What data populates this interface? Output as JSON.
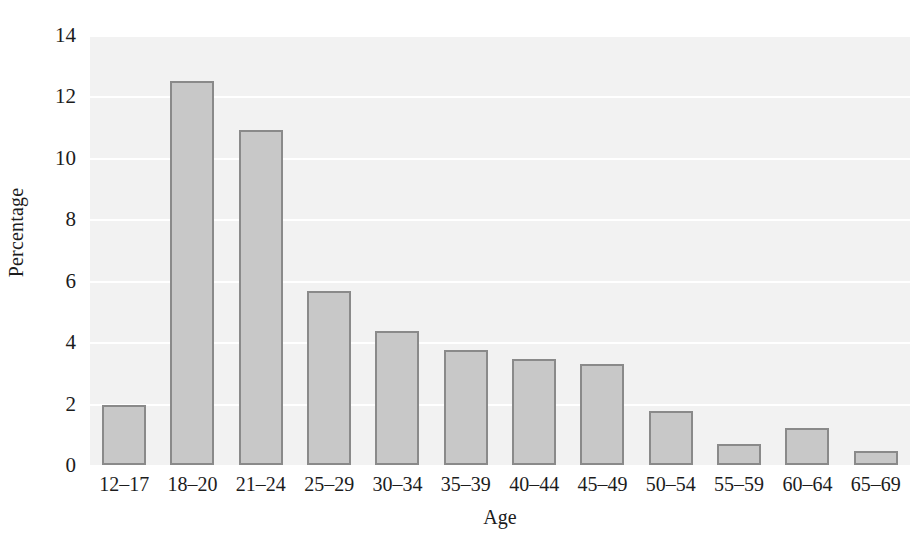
{
  "chart_data": {
    "type": "bar",
    "title": "",
    "subtitle": "",
    "xlabel": "Age",
    "ylabel": "Percentage",
    "categories": [
      "12–17",
      "18–20",
      "21–24",
      "25–29",
      "30–34",
      "35–39",
      "40–44",
      "45–49",
      "50–54",
      "55–59",
      "60–64",
      "65–69"
    ],
    "values": [
      1.95,
      12.5,
      10.9,
      5.65,
      4.35,
      3.75,
      3.45,
      3.3,
      1.75,
      0.7,
      1.2,
      0.45
    ],
    "series": [
      {
        "name": "Percentage",
        "values": [
          1.95,
          12.5,
          10.9,
          5.65,
          4.35,
          3.75,
          3.45,
          3.3,
          1.75,
          0.7,
          1.2,
          0.45
        ]
      }
    ],
    "ylim": [
      0,
      14
    ],
    "yticks": [
      0,
      2,
      4,
      6,
      8,
      10,
      12,
      14
    ],
    "ytick_labels": [
      "0",
      "2",
      "4",
      "6",
      "8",
      "10",
      "12",
      "14"
    ],
    "grid": true,
    "grid_axis": "y",
    "legend": false,
    "legend_position": "none",
    "colors": {
      "bar_fill": "#c8c8c8",
      "bar_border": "#8a8a8a",
      "plot_background": "#f2f2f2",
      "gridline": "#ffffff",
      "text": "#1c1c1c",
      "figure_background": "#ffffff"
    }
  }
}
